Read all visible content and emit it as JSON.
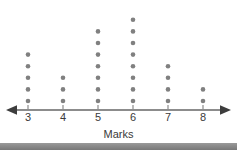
{
  "chart_data": {
    "type": "scatter",
    "plot_style": "dot-plot",
    "title": "",
    "xlabel": "Marks",
    "ylabel": "",
    "categories": [
      "3",
      "4",
      "5",
      "6",
      "7",
      "8"
    ],
    "values": [
      5,
      3,
      7,
      8,
      4,
      2
    ],
    "series": [
      {
        "name": "Frequency",
        "values": [
          5,
          3,
          7,
          8,
          4,
          2
        ]
      }
    ],
    "x": [
      3,
      4,
      5,
      6,
      7,
      8
    ],
    "xlim": [
      2.55,
      8.45
    ],
    "ylim": [
      0,
      8
    ],
    "grid": false,
    "legend": false,
    "legend_position": "none",
    "total_count": 29,
    "annotations": [],
    "axis": {
      "arrow_left": true,
      "arrow_right": true,
      "tick_labels": [
        "3",
        "4",
        "5",
        "6",
        "7",
        "8"
      ]
    },
    "colors": {
      "dot": "#808080",
      "axis": "#8c8c8c",
      "arrow": "#3d3d3d",
      "text": "#3a3a3a",
      "background": "#ffffff",
      "footer_bar": "#8a8a8a"
    }
  },
  "footer": {
    "bar_label": "page-edge-bar"
  }
}
